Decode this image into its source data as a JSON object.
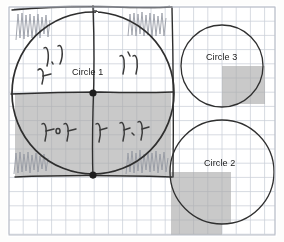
{
  "canvas": {
    "width": 284,
    "height": 242,
    "background_color": "#fdfdfc",
    "paper_color": "#ffffff",
    "description": "Scanned graph-paper sketch with three hand-drawn circles on a grid"
  },
  "grid": {
    "cell_size": 14.2,
    "minor_color": "#cfd4dd",
    "major_color": "#9aa3b0",
    "major_every": 1,
    "origin_x": 9,
    "origin_y": 7,
    "cols": 19,
    "rows": 16,
    "visible": true
  },
  "paper_border": {
    "color": "#b9bec7",
    "left": 9,
    "top": 7,
    "width": 266,
    "height": 228
  },
  "ink": {
    "pen_color": "#2b2b2b",
    "pencil_color": "#8d9199",
    "shade_color": "#a9a9a9",
    "shade_opacity": 0.62
  },
  "circles": [
    {
      "name": "Circle 1",
      "label": "Circle 1",
      "cx": 93,
      "cy": 93,
      "r": 81,
      "stroke": "#2f2f2f",
      "stroke_width": 1.6,
      "hand_drawn": true,
      "label_x": 72,
      "label_y": 67
    },
    {
      "name": "Circle 3",
      "label": "Circle 3",
      "cx": 222,
      "cy": 66,
      "r": 41,
      "stroke": "#2f2f2f",
      "stroke_width": 1.3,
      "hand_drawn": false,
      "label_x": 206,
      "label_y": 52
    },
    {
      "name": "Circle 2",
      "label": "Circle 2",
      "cx": 222,
      "cy": 172,
      "r": 52,
      "stroke": "#2f2f2f",
      "stroke_width": 1.3,
      "hand_drawn": false,
      "label_x": 204,
      "label_y": 158
    }
  ],
  "shaded_regions": [
    {
      "name": "circle1-lower-left-shade",
      "x": 15,
      "y": 93,
      "width": 156,
      "height": 82,
      "color": "#a9a9a9"
    },
    {
      "name": "circle3-lower-right-shade",
      "x": 222,
      "y": 66,
      "width": 43,
      "height": 38,
      "color": "#a9a9a9"
    },
    {
      "name": "circle2-lower-left-shade",
      "x": 171,
      "y": 172,
      "width": 51,
      "height": 63,
      "color": "#a9a9a9"
    }
  ],
  "center_dots": [
    {
      "name": "circle1-center-dot",
      "x": 93,
      "y": 93,
      "r": 3.4,
      "color": "#1d1d1d"
    },
    {
      "name": "circle1-lower-dot",
      "x": 93,
      "y": 175,
      "r": 3.4,
      "color": "#1d1d1d"
    }
  ],
  "axis_lines": [
    {
      "name": "vertical-diameter",
      "x1": 93,
      "y1": 6,
      "x2": 93,
      "y2": 178
    },
    {
      "name": "horizontal-diameter",
      "x1": 11,
      "y1": 93,
      "x2": 173,
      "y2": 92
    },
    {
      "name": "top-frame-line",
      "x1": 11,
      "y1": 10,
      "x2": 172,
      "y2": 7
    },
    {
      "name": "right-frame-line",
      "x1": 171,
      "y1": 8,
      "x2": 173,
      "y2": 177
    },
    {
      "name": "bottom-frame-line",
      "x1": 14,
      "y1": 176,
      "x2": 172,
      "y2": 177
    }
  ],
  "handwritten_notes": [
    {
      "name": "note-upper-left",
      "text": "٢٫٢",
      "x": 46,
      "y": 58,
      "rotation": -8
    },
    {
      "name": "note-upper-left-second",
      "text": "٢",
      "x": 42,
      "y": 76,
      "rotation": -4
    },
    {
      "name": "note-upper-right",
      "text": "٢٬٢",
      "x": 122,
      "y": 66,
      "rotation": -6
    },
    {
      "name": "note-lower-left",
      "text": "٢٠٢",
      "x": 44,
      "y": 133,
      "rotation": -4
    },
    {
      "name": "note-lower-middle",
      "text": "٢",
      "x": 98,
      "y": 132,
      "rotation": 0
    },
    {
      "name": "note-lower-right",
      "text": "٢٫٢",
      "x": 124,
      "y": 130,
      "rotation": -4
    }
  ],
  "scribbles": [
    {
      "name": "scribble-top-left",
      "x": 16,
      "y": 14,
      "width": 34,
      "height": 26
    },
    {
      "name": "scribble-top-right",
      "x": 128,
      "y": 12,
      "width": 40,
      "height": 24
    },
    {
      "name": "scribble-bottom-left",
      "x": 14,
      "y": 152,
      "width": 40,
      "height": 22
    },
    {
      "name": "scribble-bottom-right",
      "x": 126,
      "y": 150,
      "width": 42,
      "height": 24
    }
  ]
}
